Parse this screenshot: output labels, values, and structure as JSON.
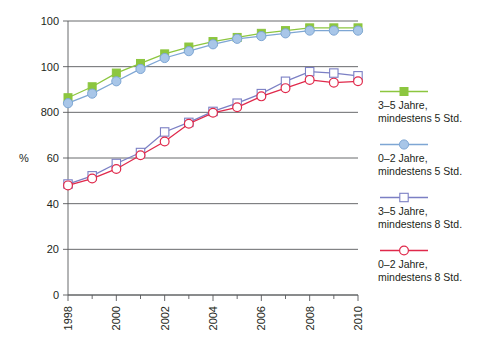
{
  "chart_data": {
    "type": "line",
    "title": "",
    "xlabel": "",
    "ylabel": "%",
    "ylim": [
      0,
      100
    ],
    "xlim": [
      1998,
      2010
    ],
    "grid": true,
    "legend_position": "right",
    "y_ticks": [
      {
        "value": 100,
        "label": "100"
      },
      {
        "value": 80,
        "label": "100"
      },
      {
        "value": 80,
        "label": "800"
      },
      {
        "value": 60,
        "label": "60"
      },
      {
        "value": 40,
        "label": "40"
      },
      {
        "value": 20,
        "label": "20"
      },
      {
        "value": 0,
        "label": "0"
      }
    ],
    "x": [
      1998,
      1999,
      2000,
      2001,
      2002,
      2003,
      2004,
      2005,
      2006,
      2007,
      2008,
      2009,
      2010
    ],
    "x_tick_labels": [
      "1998",
      "",
      "2000",
      "",
      "2002",
      "",
      "2004",
      "",
      "2006",
      "",
      "2008",
      "",
      "2010"
    ],
    "series": [
      {
        "name": "3–5 Jahre, mindestens 5 Std.",
        "marker": "filled-square",
        "color": "#8cc63f",
        "values": [
          72,
          76,
          81,
          84.5,
          88,
          90.5,
          92.5,
          94,
          95.5,
          96.5,
          97.5,
          97.5,
          97.5
        ]
      },
      {
        "name": "0–2 Jahre, mindestens 5 Std.",
        "marker": "filled-circle",
        "color": "#a8c6e8",
        "line_color": "#7ea6d4",
        "values": [
          70,
          73.5,
          78,
          82.5,
          86.5,
          89,
          91.5,
          93.5,
          94.5,
          95.5,
          96.5,
          96.5,
          96.5
        ]
      },
      {
        "name": "3–5 Jahre, mindestens 8 Std.",
        "marker": "open-square",
        "color": "#7b7fc4",
        "values": [
          40.5,
          43.5,
          48,
          52,
          59.5,
          63,
          67,
          70,
          73.5,
          78,
          81.5,
          81,
          80
        ]
      },
      {
        "name": "0–2 Jahre, mindestens 8 Std.",
        "marker": "open-circle",
        "color": "#e0294b",
        "values": [
          40,
          42.5,
          46,
          51,
          56,
          62.5,
          66.5,
          68.5,
          72.5,
          75.5,
          78.5,
          77.5,
          78
        ]
      }
    ]
  },
  "legend": {
    "items": [
      {
        "label": "3–5 Jahre,\nmindestens 5 Std.",
        "marker": "filled-square",
        "color": "#8cc63f"
      },
      {
        "label": "0–2 Jahre,\nmindestens 5 Std.",
        "marker": "filled-circle",
        "color": "#a8c6e8"
      },
      {
        "label": "3–5 Jahre,\nmindestens 8 Std.",
        "marker": "open-square",
        "color": "#7b7fc4"
      },
      {
        "label": "0–2 Jahre,\nmindestens 8 Std.",
        "marker": "open-circle",
        "color": "#e0294b"
      }
    ]
  }
}
